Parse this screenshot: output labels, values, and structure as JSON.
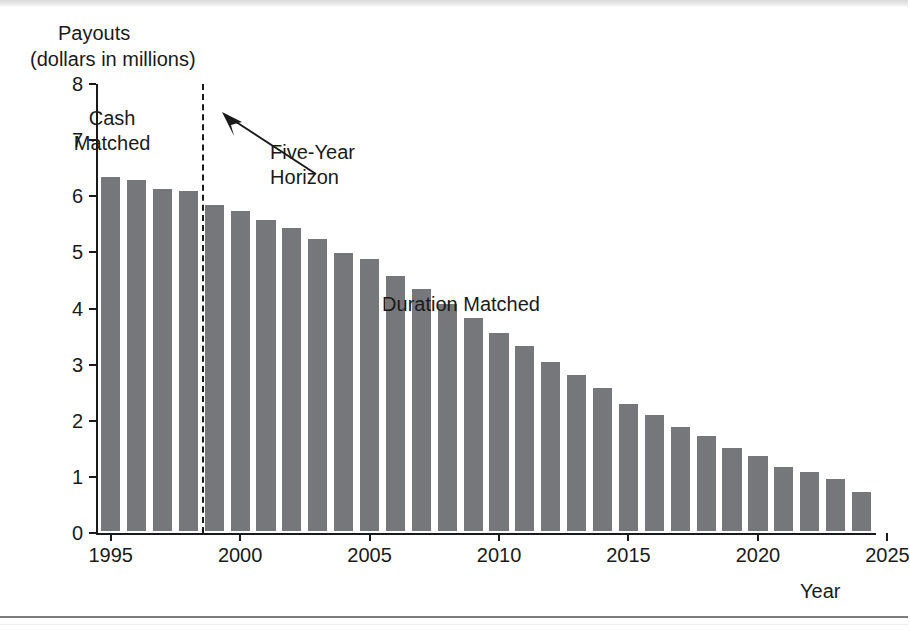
{
  "chart_data": {
    "type": "bar",
    "title": "Payouts",
    "subtitle": "(dollars in millions)",
    "ylabel": "Payouts (dollars in millions)",
    "xlabel": "Year",
    "ylim": [
      0,
      8
    ],
    "ytick_labels": [
      "0",
      "1",
      "2",
      "3",
      "4",
      "5",
      "6",
      "7",
      "8"
    ],
    "ytick_values": [
      0,
      1,
      2,
      3,
      4,
      5,
      6,
      7,
      8
    ],
    "xtick_labels": [
      "1995",
      "2000",
      "2005",
      "2010",
      "2015",
      "2020",
      "2025"
    ],
    "xtick_values": [
      1995,
      2000,
      2005,
      2010,
      2015,
      2020,
      2025
    ],
    "grid": false,
    "legend": "none",
    "bar_color": "#76777a",
    "categories": [
      "1995",
      "1996",
      "1997",
      "1998",
      "1999",
      "2000",
      "2001",
      "2002",
      "2003",
      "2004",
      "2005",
      "2006",
      "2007",
      "2008",
      "2009",
      "2010",
      "2011",
      "2012",
      "2013",
      "2014",
      "2015",
      "2016",
      "2017",
      "2018",
      "2019",
      "2020",
      "2021",
      "2022",
      "2023",
      "2024"
    ],
    "values": [
      6.3,
      6.25,
      6.1,
      6.05,
      5.8,
      5.7,
      5.55,
      5.4,
      5.2,
      4.95,
      4.85,
      4.55,
      4.32,
      4.05,
      3.8,
      3.52,
      3.3,
      3.02,
      2.78,
      2.55,
      2.26,
      2.06,
      1.85,
      1.7,
      1.48,
      1.34,
      1.14,
      1.06,
      0.92,
      0.7
    ],
    "annotations": [
      {
        "text": "Cash Matched",
        "line1": "Cash",
        "line2": "Matched",
        "region": "left-of-horizon"
      },
      {
        "text": "Duration Matched",
        "region": "right-of-horizon"
      },
      {
        "text": "Five-Year Horizon",
        "line1": "Five-Year",
        "line2": "Horizon",
        "points_to": "dashed-vertical-line-at-1998.5"
      }
    ],
    "reference_line": {
      "label": "Five-Year Horizon",
      "style": "dashed",
      "orientation": "vertical",
      "at_category_boundary": "1998/1999"
    }
  }
}
